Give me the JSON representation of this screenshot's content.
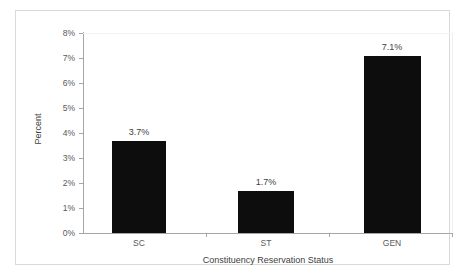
{
  "chart_data": {
    "type": "bar",
    "title": "",
    "subtitle": "",
    "xlabel": "Constituency Reservation Status",
    "ylabel": "Percent",
    "categories": [
      "SC",
      "ST",
      "GEN"
    ],
    "values": [
      3.7,
      1.7,
      7.1
    ],
    "data_labels": [
      "3.7%",
      "1.7%",
      "7.1%"
    ],
    "ylim": [
      0,
      8
    ],
    "ytick_values": [
      0,
      1,
      2,
      3,
      4,
      5,
      6,
      7,
      8
    ],
    "ytick_labels": [
      "0%",
      "1%",
      "2%",
      "3%",
      "4%",
      "5%",
      "6%",
      "7%",
      "8%"
    ],
    "grid": false,
    "legend": false,
    "legend_position": "none",
    "series": [
      {
        "name": "Percent",
        "values": [
          3.7,
          1.7,
          7.1
        ],
        "color": "#0d0d0d"
      }
    ],
    "colors": {
      "bar": "#0d0d0d",
      "axis_line": "#a6a6a6",
      "frame_border": "#d9d9d9",
      "tick_label": "#595959",
      "axis_title": "#404040",
      "data_label": "#3f3f3f",
      "background": "#ffffff"
    }
  }
}
